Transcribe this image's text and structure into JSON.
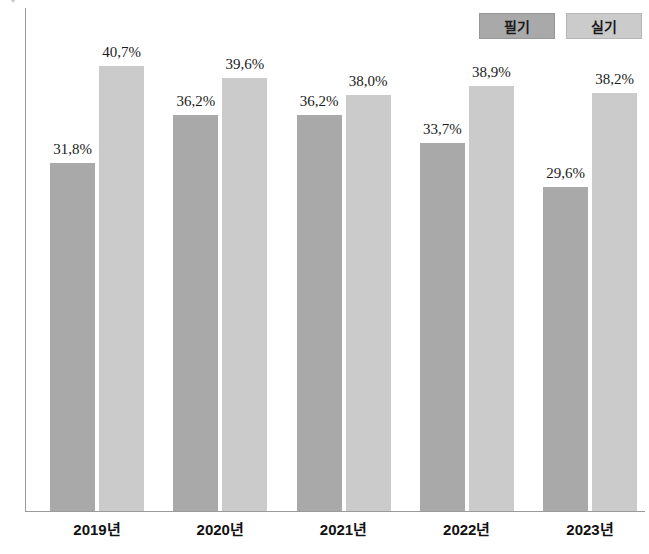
{
  "legend": {
    "items": [
      {
        "label": "필기",
        "key": "written",
        "color": "#a9a9a9"
      },
      {
        "label": "실기",
        "key": "practical",
        "color": "#cbcbcb"
      }
    ]
  },
  "chart_data": {
    "type": "bar",
    "title": "",
    "subtitle": "",
    "xlabel": "",
    "ylabel": "",
    "grid": false,
    "legend_position": "top-right",
    "ylim": [
      0,
      46
    ],
    "categories": [
      "2019년",
      "2020년",
      "2021년",
      "2022년",
      "2023년"
    ],
    "series": [
      {
        "name": "필기",
        "color": "#a9a9a9",
        "values": [
          31.8,
          36.2,
          36.2,
          33.7,
          29.6
        ],
        "labels": [
          "31,8%",
          "36,2%",
          "36,2%",
          "33,7%",
          "29,6%"
        ]
      },
      {
        "name": "실기",
        "color": "#cbcbcb",
        "values": [
          40.7,
          39.6,
          38.0,
          38.9,
          38.2
        ],
        "labels": [
          "40,7%",
          "39,6%",
          "38,0%",
          "38,9%",
          "38,2%"
        ]
      }
    ]
  },
  "axis": {
    "line_color": "#9a9a9a"
  }
}
